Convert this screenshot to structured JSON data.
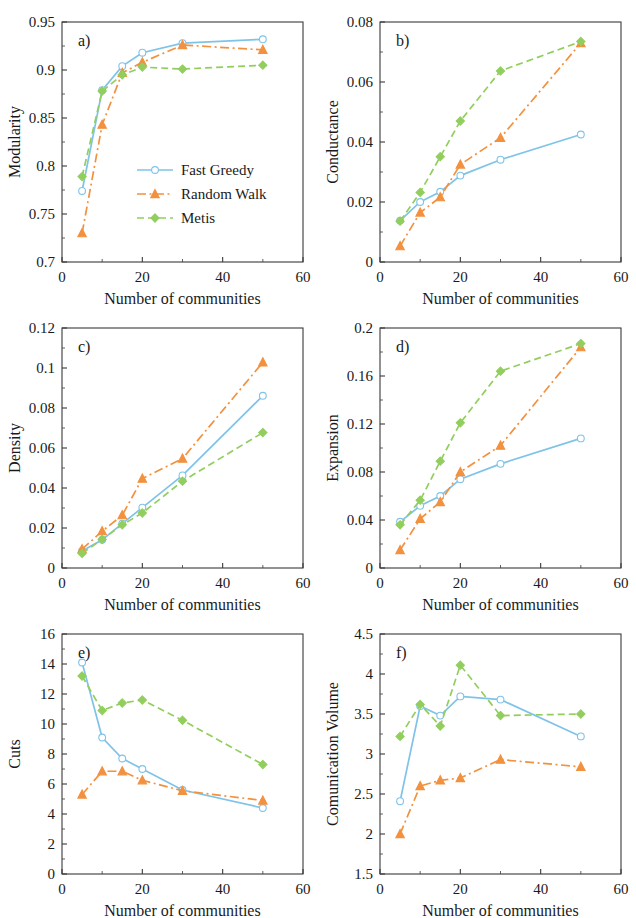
{
  "figure": {
    "series_styles": [
      {
        "key": "fast_greedy",
        "label": "Fast Greedy",
        "color": "#7FC3E8",
        "dash": "none",
        "marker": "circle"
      },
      {
        "key": "random_walk",
        "label": "Random Walk",
        "color": "#F2913F",
        "dash": "dashdot",
        "marker": "triangle"
      },
      {
        "key": "metis",
        "label": "Metis",
        "color": "#92CE5E",
        "dash": "dashed",
        "marker": "diamond"
      }
    ],
    "legend": {
      "panel": "a",
      "entries": [
        "Fast Greedy",
        "Random Walk",
        "Metis"
      ]
    },
    "shared_xlabel": "Number of communities",
    "shared_x": [
      5,
      10,
      15,
      20,
      30,
      50
    ],
    "xlim": [
      0,
      60
    ],
    "xticks": [
      0,
      20,
      40,
      60
    ]
  },
  "chart_data": [
    {
      "type": "line",
      "panel": "a)",
      "title": "",
      "xlabel": "Number of communities",
      "ylabel": "Modularity",
      "x": [
        5,
        10,
        15,
        20,
        30,
        50
      ],
      "xlim": [
        0,
        60
      ],
      "xticks": [
        0,
        20,
        40,
        60
      ],
      "ylim": [
        0.7,
        0.95
      ],
      "yticks": [
        0.7,
        0.75,
        0.8,
        0.85,
        0.9,
        0.95
      ],
      "ytick_labels": [
        "0.7",
        "0.75",
        "0.8",
        "0.85",
        "0.9",
        "0.95"
      ],
      "grid": false,
      "legend_position": "center-right",
      "series": [
        {
          "name": "Fast Greedy",
          "values": [
            0.774,
            0.879,
            0.904,
            0.918,
            0.928,
            0.932
          ]
        },
        {
          "name": "Random Walk",
          "values": [
            0.73,
            0.843,
            0.897,
            0.908,
            0.926,
            0.921
          ]
        },
        {
          "name": "Metis",
          "values": [
            0.789,
            0.878,
            0.895,
            0.903,
            0.901,
            0.905
          ]
        }
      ]
    },
    {
      "type": "line",
      "panel": "b)",
      "title": "",
      "xlabel": "Number of communities",
      "ylabel": "Conductance",
      "x": [
        5,
        10,
        15,
        20,
        30,
        50
      ],
      "xlim": [
        0,
        60
      ],
      "xticks": [
        0,
        20,
        40,
        60
      ],
      "ylim": [
        0,
        0.08
      ],
      "yticks": [
        0,
        0.02,
        0.04,
        0.06,
        0.08
      ],
      "ytick_labels": [
        "0",
        "0.02",
        "0.04",
        "0.06",
        "0.08"
      ],
      "grid": false,
      "legend_position": "none",
      "series": [
        {
          "name": "Fast Greedy",
          "values": [
            0.0138,
            0.02,
            0.0234,
            0.0288,
            0.0341,
            0.0425
          ]
        },
        {
          "name": "Random Walk",
          "values": [
            0.0053,
            0.0165,
            0.0216,
            0.0325,
            0.0414,
            0.073
          ]
        },
        {
          "name": "Metis",
          "values": [
            0.0136,
            0.0232,
            0.0351,
            0.047,
            0.0637,
            0.0735
          ]
        }
      ]
    },
    {
      "type": "line",
      "panel": "c)",
      "title": "",
      "xlabel": "Number of communities",
      "ylabel": "Density",
      "x": [
        5,
        10,
        15,
        20,
        30,
        50
      ],
      "xlim": [
        0,
        60
      ],
      "xticks": [
        0,
        20,
        40,
        60
      ],
      "ylim": [
        0,
        0.12
      ],
      "yticks": [
        0,
        0.02,
        0.04,
        0.06,
        0.08,
        0.1,
        0.12
      ],
      "ytick_labels": [
        "0",
        "0.02",
        "0.04",
        "0.06",
        "0.08",
        "0.1",
        "0.12"
      ],
      "grid": false,
      "legend_position": "none",
      "series": [
        {
          "name": "Fast Greedy",
          "values": [
            0.0085,
            0.0141,
            0.0222,
            0.0302,
            0.0463,
            0.0861
          ]
        },
        {
          "name": "Random Walk",
          "values": [
            0.0094,
            0.0184,
            0.0264,
            0.0447,
            0.0547,
            0.1028
          ]
        },
        {
          "name": "Metis",
          "values": [
            0.0073,
            0.0143,
            0.0216,
            0.0275,
            0.0434,
            0.0677
          ]
        }
      ]
    },
    {
      "type": "line",
      "panel": "d)",
      "title": "",
      "xlabel": "Number of communities",
      "ylabel": "Expansion",
      "x": [
        5,
        10,
        15,
        20,
        30,
        50
      ],
      "xlim": [
        0,
        60
      ],
      "xticks": [
        0,
        20,
        40,
        60
      ],
      "ylim": [
        0,
        0.2
      ],
      "yticks": [
        0,
        0.04,
        0.08,
        0.12,
        0.16,
        0.2
      ],
      "ytick_labels": [
        "0",
        "0.04",
        "0.08",
        "0.12",
        "0.16",
        "0.2"
      ],
      "grid": false,
      "legend_position": "none",
      "series": [
        {
          "name": "Fast Greedy",
          "values": [
            0.0385,
            0.0518,
            0.06,
            0.074,
            0.0868,
            0.108
          ]
        },
        {
          "name": "Random Walk",
          "values": [
            0.015,
            0.041,
            0.055,
            0.08,
            0.102,
            0.184
          ]
        },
        {
          "name": "Metis",
          "values": [
            0.036,
            0.0565,
            0.089,
            0.121,
            0.164,
            0.187
          ]
        }
      ]
    },
    {
      "type": "line",
      "panel": "e)",
      "title": "",
      "xlabel": "Number of communities",
      "ylabel": "Cuts",
      "x": [
        5,
        10,
        15,
        20,
        30,
        50
      ],
      "xlim": [
        0,
        60
      ],
      "xticks": [
        0,
        20,
        40,
        60
      ],
      "ylim": [
        0,
        16
      ],
      "yticks": [
        0,
        2,
        4,
        6,
        8,
        10,
        12,
        14,
        16
      ],
      "ytick_labels": [
        "0",
        "2",
        "4",
        "6",
        "8",
        "10",
        "12",
        "14",
        "16"
      ],
      "grid": false,
      "legend_position": "none",
      "series": [
        {
          "name": "Fast Greedy",
          "values": [
            14.1,
            9.1,
            7.7,
            7.0,
            5.6,
            4.4
          ]
        },
        {
          "name": "Random Walk",
          "values": [
            5.3,
            6.85,
            6.85,
            6.25,
            5.55,
            4.9
          ]
        },
        {
          "name": "Metis",
          "values": [
            13.2,
            10.9,
            11.4,
            11.6,
            10.25,
            7.3
          ]
        }
      ]
    },
    {
      "type": "line",
      "panel": "f)",
      "title": "",
      "xlabel": "Number of communities",
      "ylabel": "Comunication  Volume",
      "x": [
        5,
        10,
        15,
        20,
        30,
        50
      ],
      "xlim": [
        0,
        60
      ],
      "xticks": [
        0,
        20,
        40,
        60
      ],
      "ylim": [
        1.5,
        4.5
      ],
      "yticks": [
        1.5,
        2,
        2.5,
        3,
        3.5,
        4,
        4.5
      ],
      "ytick_labels": [
        "1.5",
        "2",
        "2.5",
        "3",
        "3.5",
        "4",
        "4.5"
      ],
      "grid": false,
      "legend_position": "none",
      "series": [
        {
          "name": "Fast Greedy",
          "values": [
            2.41,
            3.6,
            3.48,
            3.72,
            3.68,
            3.22
          ]
        },
        {
          "name": "Random Walk",
          "values": [
            2.0,
            2.6,
            2.67,
            2.7,
            2.93,
            2.84
          ]
        },
        {
          "name": "Metis",
          "values": [
            3.22,
            3.62,
            3.35,
            4.11,
            3.48,
            3.5
          ]
        }
      ]
    }
  ]
}
